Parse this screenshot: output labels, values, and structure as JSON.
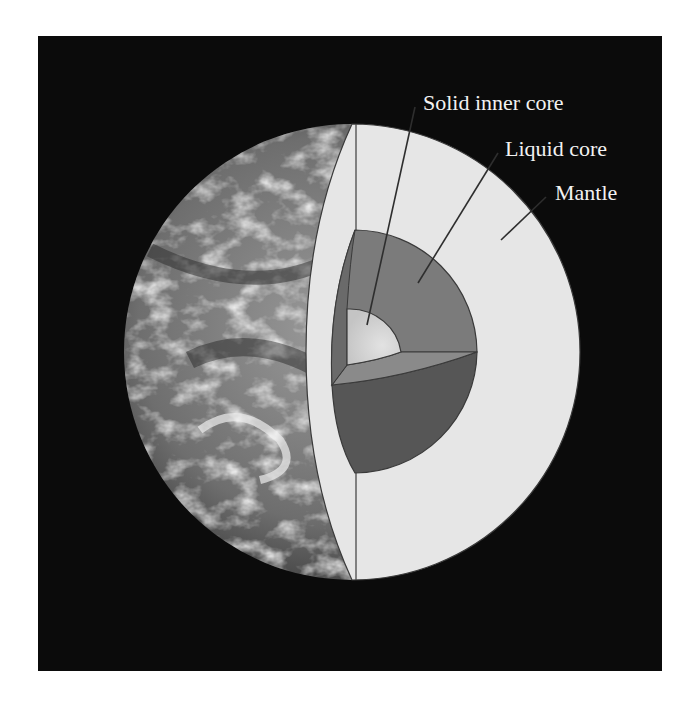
{
  "figure": {
    "background_color": "#0b0b0b",
    "labels": [
      {
        "id": "inner-core",
        "text": "Solid inner core"
      },
      {
        "id": "liquid-core",
        "text": "Liquid core"
      },
      {
        "id": "mantle",
        "text": "Mantle"
      }
    ],
    "colors": {
      "mantle": "#e6e6e6",
      "liquid_core_upper": "#7b7b7b",
      "liquid_core_side": "#6a6a6a",
      "liquid_core_lower": "#565656",
      "inner_core": "#d0d0d0",
      "outline": "#3a3a3a",
      "label_text": "#f2f2f2"
    }
  }
}
